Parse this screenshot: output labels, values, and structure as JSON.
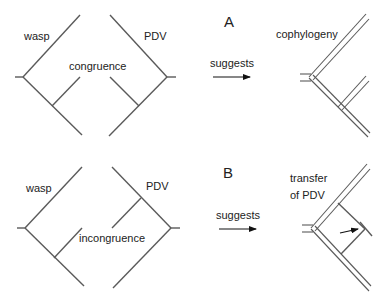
{
  "panels": {
    "A": {
      "letter": "A",
      "host_label": "wasp",
      "virus_label": "PDV",
      "relation_label": "congruence",
      "arrow_label": "suggests",
      "result_label": "cophylogeny"
    },
    "B": {
      "letter": "B",
      "host_label": "wasp",
      "virus_label": "PDV",
      "relation_label": "incongruence",
      "arrow_label": "suggests",
      "result_label_line1": "transfer",
      "result_label_line2": "of PDV"
    }
  },
  "colors": {
    "tree_line": "#5a5a5a",
    "text": "#222222",
    "arrow": "#111111"
  }
}
